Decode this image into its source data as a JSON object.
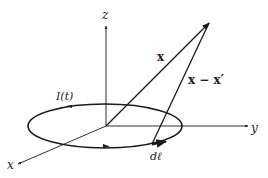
{
  "diagram": {
    "labels": {
      "z_axis": "z",
      "y_axis": "y",
      "x_axis": "x",
      "position_vector": "x",
      "separation_vector": "x − x′",
      "current": "I(t)",
      "line_element": "dℓ"
    },
    "colors": {
      "stroke": "#1a1a1a",
      "background": "#ffffff"
    }
  }
}
